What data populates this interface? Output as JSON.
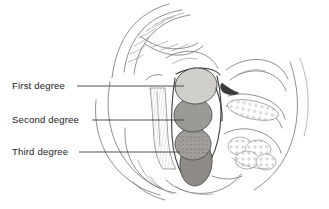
{
  "figure": {
    "background_color": "#ffffff",
    "width": 329,
    "height": 209
  },
  "labels": [
    {
      "id": "first-degree",
      "text": "First degree",
      "text_x": 12,
      "text_y": 89,
      "leader_from_x": 77,
      "leader_to_x": 184,
      "leader_y": 86
    },
    {
      "id": "second-degree",
      "text": "Second degree",
      "text_x": 12,
      "text_y": 123,
      "leader_from_x": 92,
      "leader_to_x": 184,
      "leader_y": 120
    },
    {
      "id": "third-degree",
      "text": "Third degree",
      "text_x": 12,
      "text_y": 155,
      "leader_from_x": 79,
      "leader_to_x": 180,
      "leader_y": 152
    }
  ],
  "masses": [
    {
      "id": "first-degree-mass",
      "name": "first-degree-hemorrhoid",
      "fill_color": "#d2d0cd",
      "cx": 196,
      "cy": 86,
      "rx": 21,
      "ry": 18,
      "rotation": -8
    },
    {
      "id": "second-degree-mass",
      "name": "second-degree-hemorrhoid",
      "fill_color": "#9c9a97",
      "cx": 193,
      "cy": 115,
      "rx": 19,
      "ry": 17,
      "rotation": -4
    },
    {
      "id": "third-degree-mass",
      "name": "third-degree-hemorrhoid",
      "fill_color": "#a3a09c",
      "cx": 193,
      "cy": 144,
      "rx": 18,
      "ry": 16,
      "rotation": 0
    },
    {
      "id": "third-degree-prolapse",
      "name": "third-degree-prolapsed-mass",
      "fill_color": "#8f8c88",
      "cx": 196,
      "cy": 163,
      "rx": 16,
      "ry": 23,
      "rotation": 6
    }
  ],
  "anatomy": {
    "sacrum_label": "sacrum-coccyx",
    "rectal_wall_label": "rectal-wall",
    "pelvic_floor_label": "pelvic-floor",
    "bladder_label": "bladder-and-pubic-region",
    "body_contour_label": "body-contour",
    "line_color": "#6b6b6b",
    "dark_line_color": "#3d3d3d"
  }
}
